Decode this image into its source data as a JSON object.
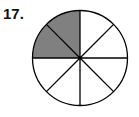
{
  "problem_number": "17.",
  "fraction_circle": {
    "total_parts": 8,
    "shaded_parts": [
      2,
      3
    ],
    "shaded_count": 2,
    "shade_color": "#808080",
    "line_color": "#000000",
    "fill_color": "#ffffff"
  }
}
